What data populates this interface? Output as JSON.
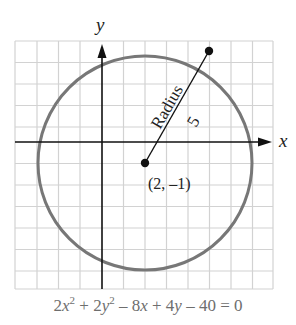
{
  "figure": {
    "axis_x_label": "x",
    "axis_y_label": "y",
    "radius_label": "Radius",
    "radius_value": "5",
    "center_label": "(2, –1)",
    "equation": {
      "part1": "2",
      "x": "x",
      "exp1": "2",
      "part2": " + 2",
      "y": "y",
      "exp2": "2",
      "part3": " – 8",
      "x2": "x",
      "part4": " + 4",
      "y2": "y",
      "part5": " – 40 = 0"
    },
    "circle": {
      "center": [
        2,
        -1
      ],
      "radius": 5
    },
    "radius_endpoint": [
      5,
      3
    ],
    "grid": {
      "x_range": [
        -4,
        8
      ],
      "y_range": [
        -7,
        4.6
      ],
      "step": 1
    },
    "colors": {
      "circle": "#777777",
      "grid": "#d0d0d0",
      "axes": "#111111",
      "points": "#111111"
    }
  }
}
